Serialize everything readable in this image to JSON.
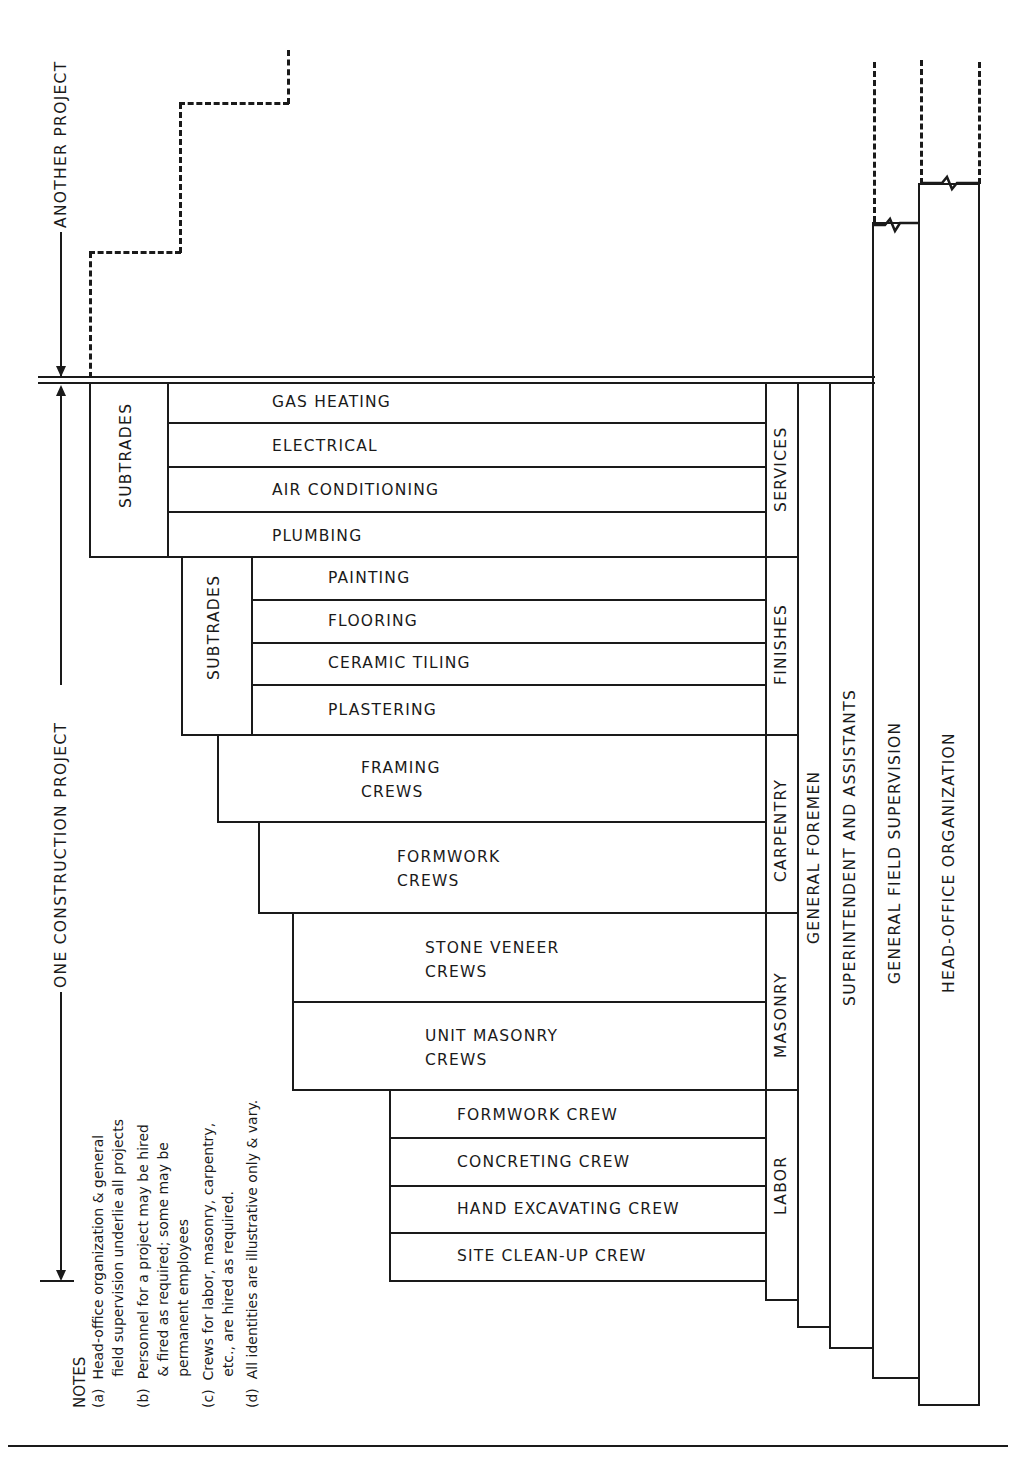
{
  "diagram": {
    "type": "organization-chart",
    "spans": {
      "another_project": "ANOTHER PROJECT",
      "one_construction_project": "ONE CONSTRUCTION PROJECT"
    },
    "permanent_levels": [
      {
        "id": "head_office",
        "label": "HEAD-OFFICE ORGANIZATION"
      },
      {
        "id": "general_field",
        "label": "GENERAL FIELD SUPERVISION"
      },
      {
        "id": "superintendent",
        "label": "SUPERINTENDENT AND ASSISTANTS"
      },
      {
        "id": "general_foremen",
        "label": "GENERAL FOREMEN"
      }
    ],
    "categories": [
      {
        "label": "SERVICES",
        "group_label": "SUBTRADES",
        "items": [
          "GAS HEATING",
          "ELECTRICAL",
          "AIR CONDITIONING",
          "PLUMBING"
        ]
      },
      {
        "label": "FINISHES",
        "group_label": "SUBTRADES",
        "items": [
          "PAINTING",
          "FLOORING",
          "CERAMIC TILING",
          "PLASTERING"
        ]
      },
      {
        "label": "CARPENTRY",
        "items": [
          [
            "FRAMING",
            "CREWS"
          ],
          [
            "FORMWORK",
            "CREWS"
          ]
        ]
      },
      {
        "label": "MASONRY",
        "items": [
          [
            "STONE VENEER",
            "CREWS"
          ],
          [
            "UNIT MASONRY",
            "CREWS"
          ]
        ]
      },
      {
        "label": "LABOR",
        "items": [
          "FORMWORK CREW",
          "CONCRETING CREW",
          "HAND EXCAVATING  CREW",
          "SITE CLEAN-UP  CREW"
        ]
      }
    ],
    "notes": {
      "title": "NOTES",
      "items": [
        "(a)  Head-office organization & general\n       field supervision underlie all projects",
        "(b)  Personnel for a project may be hired\n       & fired as required; some may be\n       permanent employees",
        "(c)  Crews for labor, masonry, carpentry,\n       etc., are hired as required.",
        "(d)  All identities are illustrative only & vary."
      ]
    }
  }
}
